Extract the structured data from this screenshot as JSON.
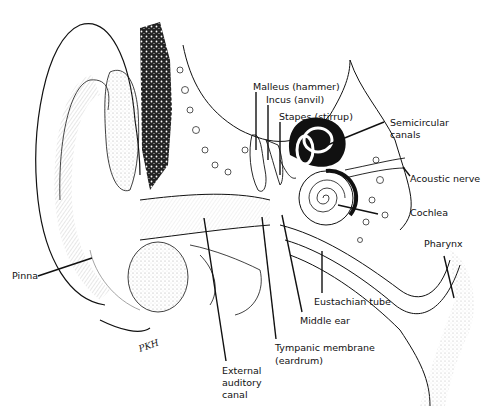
{
  "diagram": {
    "signature": "PKH",
    "labels": {
      "malleus": "Malleus (hammer)",
      "incus": "Incus (anvil)",
      "stapes": "Stapes (stirrup)",
      "semicircular_1": "Semicircular",
      "semicircular_2": "canals",
      "acoustic_nerve": "Acoustic nerve",
      "cochlea": "Cochlea",
      "pharynx": "Pharynx",
      "pinna": "Pinna",
      "eustachian_tube": "Eustachian tube",
      "middle_ear": "Middle ear",
      "tympanic_1": "Tympanic membrane",
      "tympanic_2": "(eardrum)",
      "external_1": "External",
      "external_2": "auditory",
      "external_3": "canal"
    },
    "colors": {
      "ink": "#111111",
      "background": "#ffffff",
      "stipple": "#9a9a9a"
    }
  }
}
